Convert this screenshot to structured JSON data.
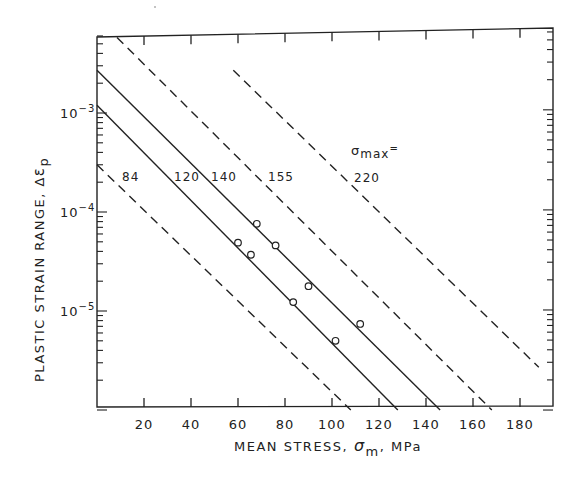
{
  "chart_data": {
    "type": "line",
    "title": "",
    "xlabel": "MEAN STRESS, σm, MPa",
    "xlabel_parts": {
      "pre": "MEAN STRESS, ",
      "sym": "σ",
      "sub": "m",
      "post": ", MPa"
    },
    "ylabel": "PLASTIC STRAIN RANGE, Δεp",
    "ylabel_parts": {
      "pre": "PLASTIC STRAIN RANGE, Δ",
      "sym": "ε",
      "sub": "p"
    },
    "xlim": [
      0,
      195
    ],
    "ylim": [
      1e-06,
      0.006
    ],
    "yscale": "log",
    "x_ticks": [
      20,
      40,
      60,
      80,
      100,
      120,
      140,
      160,
      180
    ],
    "x_tick_labels": [
      "20",
      "40",
      "60",
      "80",
      "100",
      "120",
      "140",
      "160",
      "180"
    ],
    "y_ticks": [
      1e-05,
      0.0001,
      0.001
    ],
    "y_tick_labels": [
      {
        "base": "10",
        "exp": "-5"
      },
      {
        "base": "10",
        "exp": "-4"
      },
      {
        "base": "10",
        "exp": "-3"
      }
    ],
    "grid": false,
    "legend_note": {
      "prefix_sym": "σ",
      "prefix_sub": "max",
      "prefix_eq": "="
    },
    "series": [
      {
        "name": "84",
        "style": "dashed",
        "x": [
          0,
          108
        ],
        "y": [
          0.0003,
          1e-06
        ],
        "label_pos": [
          122,
          176
        ]
      },
      {
        "name": "120",
        "style": "solid",
        "x": [
          0,
          128
        ],
        "y": [
          0.0012,
          1e-06
        ],
        "label_pos": [
          174,
          176
        ]
      },
      {
        "name": "140",
        "style": "solid",
        "x": [
          0,
          146
        ],
        "y": [
          0.0027,
          1e-06
        ],
        "label_pos": [
          211,
          176
        ]
      },
      {
        "name": "155",
        "style": "dashed",
        "x": [
          8.5,
          168
        ],
        "y": [
          0.0058,
          1e-06
        ],
        "label_pos": [
          268,
          176
        ]
      },
      {
        "name": "220",
        "style": "dashed",
        "x": [
          58,
          188
        ],
        "y": [
          0.0027,
          2.7e-06
        ],
        "label_pos": [
          354,
          177
        ]
      }
    ],
    "points": {
      "name": "experimental data",
      "marker": "open-circle",
      "x": [
        60,
        65.5,
        68,
        76,
        83.5,
        90,
        101.5,
        112
      ],
      "y": [
        4.9e-05,
        3.7e-05,
        7.6e-05,
        4.6e-05,
        1.23e-05,
        1.78e-05,
        5e-06,
        7.4e-06
      ]
    },
    "colors": {
      "ink": "#222222",
      "background": "#ffffff"
    }
  }
}
